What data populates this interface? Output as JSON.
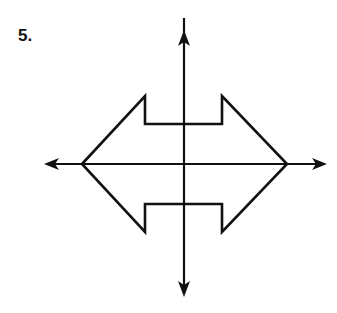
{
  "problem": {
    "number": "5."
  },
  "diagram": {
    "type": "coordinate-plane-figure",
    "stroke_color": "#111111",
    "axes": {
      "x_axis": {
        "y": 164,
        "x_start": 45,
        "x_end": 327
      },
      "y_axis": {
        "x": 184,
        "y_start": 8,
        "y_end": 297
      }
    },
    "polygon_points": [
      [
        82,
        164
      ],
      [
        145,
        96
      ],
      [
        145,
        124
      ],
      [
        222,
        124
      ],
      [
        222,
        96
      ],
      [
        287,
        164
      ],
      [
        222,
        232
      ],
      [
        222,
        204
      ],
      [
        145,
        204
      ],
      [
        145,
        232
      ]
    ]
  }
}
